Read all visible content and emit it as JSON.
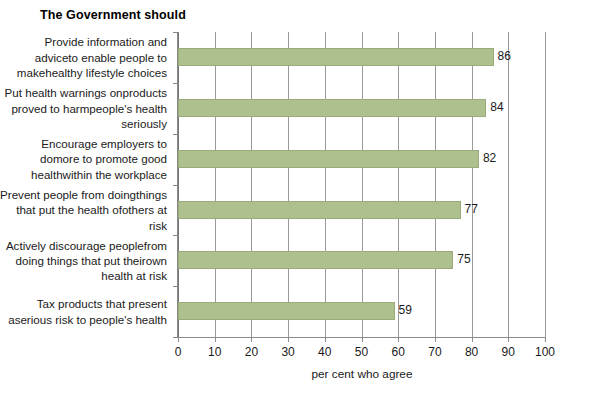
{
  "chart_data": {
    "type": "bar",
    "orientation": "horizontal",
    "title": "The Government should",
    "xlabel": "per cent who agree",
    "ylabel": "",
    "xlim": [
      0,
      100
    ],
    "xticks": [
      0,
      10,
      20,
      30,
      40,
      50,
      60,
      70,
      80,
      90,
      100
    ],
    "grid": true,
    "grid_axis": "x",
    "legend": null,
    "bar_color": "#aec08d",
    "bar_edge_color": "#9aab7b",
    "categories": [
      "Provide information and advice to enable people to make healthy lifestyle choices",
      "Put health warnings on products proved to harm people's health seriously",
      "Encourage employers to do more to promote good health within the workplace",
      "Prevent people from doing things that put the health of others at risk",
      "Actively discourage people from doing things that put their own health at risk",
      "Tax products that present a serious risk to people's health"
    ],
    "category_lines": [
      [
        "Provide information and advice",
        "to enable people to make",
        "healthy lifestyle choices"
      ],
      [
        "Put health warnings on",
        "products proved to harm",
        "people's health seriously"
      ],
      [
        "Encourage employers to do",
        "more to promote good health",
        "within the workplace"
      ],
      [
        "Prevent people from doing",
        "things that put the health of",
        "others at risk"
      ],
      [
        "Actively discourage people",
        "from doing things that put their",
        "own health at risk"
      ],
      [
        "Tax products that present a",
        "serious risk to people's health"
      ]
    ],
    "values": [
      86,
      84,
      82,
      77,
      75,
      59
    ],
    "value_labels": [
      "86",
      "84",
      "82",
      "77",
      "75",
      "59"
    ]
  }
}
